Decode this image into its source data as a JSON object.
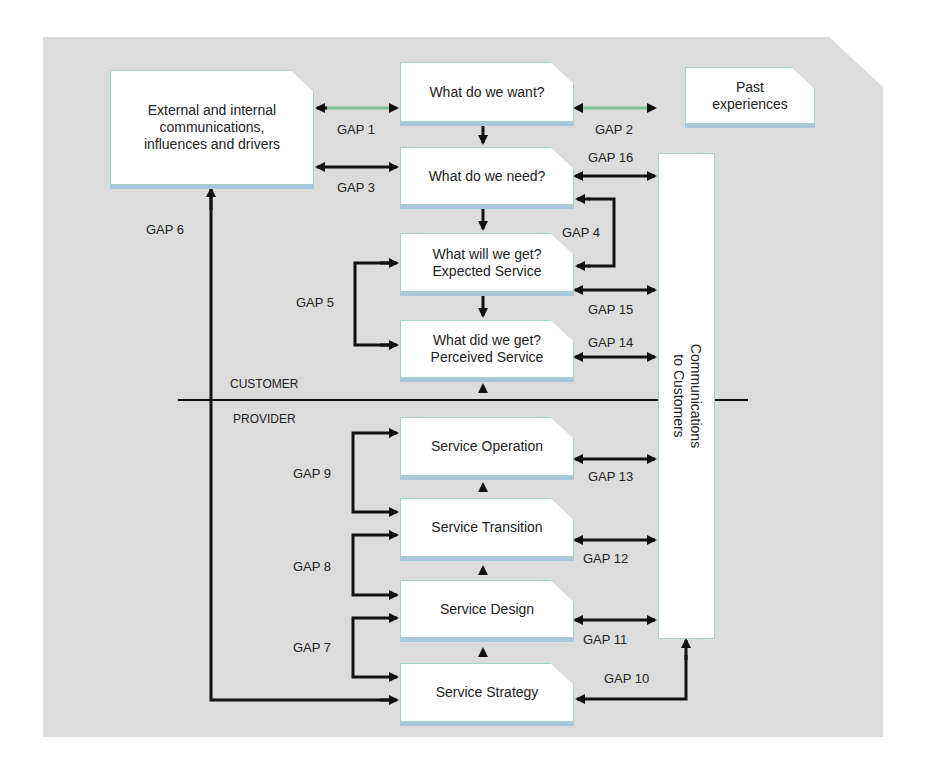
{
  "diagram": {
    "sections": {
      "customer": "CUSTOMER",
      "provider": "PROVIDER"
    },
    "boxes": {
      "external": [
        "External and internal",
        "communications,",
        "influences and drivers"
      ],
      "want": [
        "What do we want?"
      ],
      "past": [
        "Past",
        "experiences"
      ],
      "need": [
        "What do we need?"
      ],
      "expected": [
        "What will we get?",
        "Expected Service"
      ],
      "perceived": [
        "What did we get?",
        "Perceived Service"
      ],
      "operation": [
        "Service  Operation"
      ],
      "transition": [
        "Service  Transition"
      ],
      "design": [
        "Service  Design"
      ],
      "strategy": [
        "Service  Strategy"
      ],
      "communications": [
        "Communications",
        "to Customers"
      ]
    },
    "gaps": {
      "g1": "GAP 1",
      "g2": "GAP 2",
      "g3": "GAP 3",
      "g4": "GAP 4",
      "g5": "GAP 5",
      "g6": "GAP 6",
      "g7": "GAP 7",
      "g8": "GAP 8",
      "g9": "GAP 9",
      "g10": "GAP 10",
      "g11": "GAP 11",
      "g12": "GAP 12",
      "g13": "GAP 13",
      "g14": "GAP 14",
      "g15": "GAP 15",
      "g16": "GAP 16"
    },
    "colors": {
      "panel": "#dcdcdc",
      "box_border": "#a8d0cc",
      "box_shadow": "#a9c8dd",
      "gap_green": "#7fbf9a",
      "line": "#111111"
    }
  }
}
